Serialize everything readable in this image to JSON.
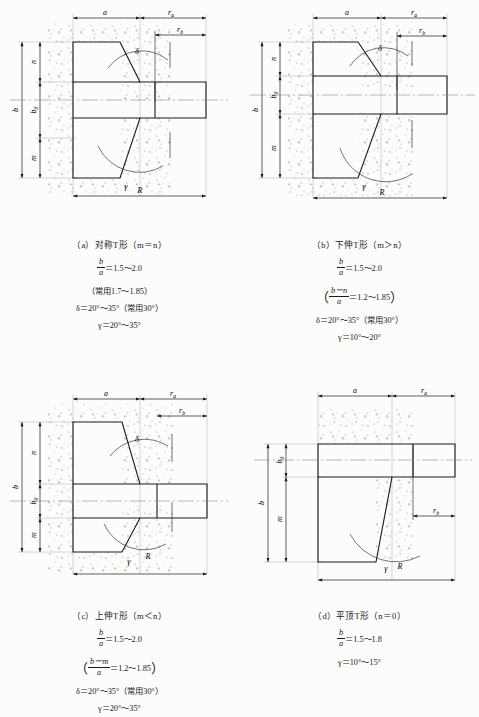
{
  "figure": {
    "background_color": "#fcfcfa",
    "line_color": "#1a1a1a",
    "hatch_color": "#8a8a8a"
  },
  "panels": [
    {
      "id": "a",
      "caption_title": "（a）对称T形（m＝n）",
      "formula_ratio_num": "b",
      "formula_ratio_den": "a",
      "formula_ratio_value": "＝1.5～2.0",
      "note_line": "（常用1.7～1.85）",
      "delta_line": "δ＝20°～35°（常用30°）",
      "gamma_line": "γ＝20°～35°",
      "labels": {
        "a": "a",
        "b": "b",
        "b0": "b",
        "b0_sub": "0",
        "m": "m",
        "n": "n",
        "R": "R",
        "ra": "r",
        "ra_sub": "a",
        "rb": "r",
        "rb_sub": "b",
        "delta": "δ",
        "gamma": "γ"
      }
    },
    {
      "id": "b",
      "caption_title": "（b）下伸T形（m＞n）",
      "formula_ratio_num": "b",
      "formula_ratio_den": "a",
      "formula_ratio_value": "＝1.5～2.0",
      "note_frac_num": "b－n",
      "note_frac_den": "a",
      "note_frac_value": "＝1.2～1.85",
      "delta_line": "δ＝20°～35°（常用30°）",
      "gamma_line": "γ＝10°～20°",
      "labels": {
        "a": "a",
        "b": "b",
        "b0": "b",
        "b0_sub": "0",
        "m": "m",
        "n": "n",
        "R": "R",
        "ra": "r",
        "ra_sub": "a",
        "rb": "r",
        "rb_sub": "b",
        "delta": "δ",
        "gamma": "γ"
      }
    },
    {
      "id": "c",
      "caption_title": "（c）上伸T形（m＜n）",
      "formula_ratio_num": "b",
      "formula_ratio_den": "a",
      "formula_ratio_value": "＝1.5～2.0",
      "note_frac_num": "b－m",
      "note_frac_den": "a",
      "note_frac_value": "＝1.2～1.85",
      "delta_line": "δ＝20°～35°（常用30°）",
      "gamma_line": "γ＝20°～35°",
      "labels": {
        "a": "a",
        "b": "b",
        "b0": "b",
        "b0_sub": "0",
        "m": "m",
        "n": "n",
        "R": "R",
        "ra": "r",
        "ra_sub": "a",
        "rb": "r",
        "rb_sub": "b",
        "delta": "δ",
        "gamma": "γ"
      }
    },
    {
      "id": "d",
      "caption_title": "（d）平顶T形（n＝0）",
      "formula_ratio_num": "b",
      "formula_ratio_den": "a",
      "formula_ratio_value": "＝1.5～1.8",
      "gamma_line": "γ＝10°～15°",
      "labels": {
        "a": "a",
        "b": "b",
        "b0": "b",
        "b0_sub": "0",
        "m": "m",
        "R": "R",
        "ra": "r",
        "ra_sub": "a",
        "rb": "r",
        "rb_sub": "b",
        "gamma": "γ"
      }
    }
  ]
}
